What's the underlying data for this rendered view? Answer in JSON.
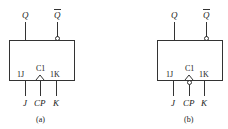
{
  "diagrams": [
    {
      "id": "a",
      "caption": "(a)",
      "outputs": {
        "q": "Q",
        "q_bar": "Q",
        "q_bar_overline": true
      },
      "pins": {
        "j": "1J",
        "clock": "C1",
        "k": "1K"
      },
      "inputs": {
        "j": "J",
        "cp": "CP",
        "k": "K"
      },
      "clock_inverted": false,
      "qbar_inverted": true
    },
    {
      "id": "b",
      "caption": "(b)",
      "outputs": {
        "q": "Q",
        "q_bar": "Q",
        "q_bar_overline": true
      },
      "pins": {
        "j": "1J",
        "clock": "C1",
        "k": "1K"
      },
      "inputs": {
        "j": "J",
        "cp": "CP",
        "k": "K"
      },
      "clock_inverted": true,
      "qbar_inverted": true
    }
  ]
}
